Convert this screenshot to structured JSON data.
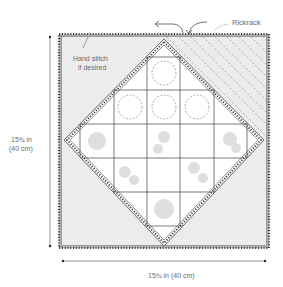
{
  "labels": {
    "rickrack": "Rickrack",
    "hand_stitch_line1": "Hand stitch",
    "hand_stitch_line2": "if desired",
    "height_line1": "15¾ in",
    "height_line2": "(40 cm)",
    "width": "15¾ in (40 cm)"
  },
  "colors": {
    "background": "#ffffff",
    "corner_fill": "#ececec",
    "line": "#4a4a4a",
    "motif": "#d6d6d6",
    "text": "#6b6b6b"
  }
}
